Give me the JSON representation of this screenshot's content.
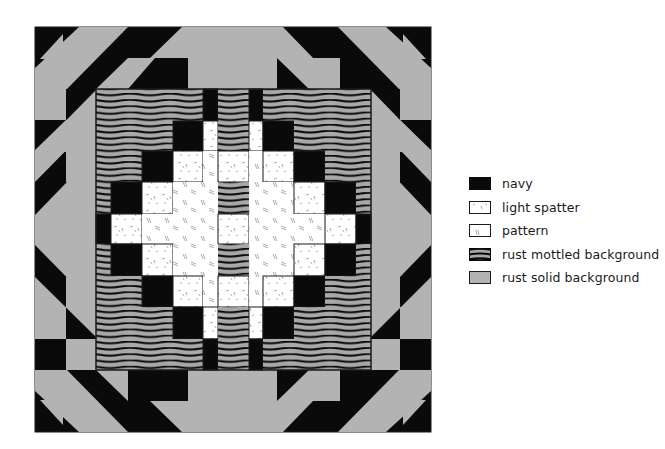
{
  "colors": {
    "navy": "#0a0a0a",
    "light_spatter": "#ffffff",
    "pattern": "#ffffff",
    "rust_mottled_background": "#a8a8a8",
    "rust_solid_background": "#b3b3b3",
    "outline": "#1a1a1a"
  },
  "legend": {
    "items": [
      {
        "key": "N",
        "label": "navy",
        "icon": "navy-swatch"
      },
      {
        "key": "S",
        "label": "light spatter",
        "icon": "light-spatter-swatch"
      },
      {
        "key": "P",
        "label": "pattern",
        "icon": "pattern-swatch"
      },
      {
        "key": "M",
        "label": "rust mottled background",
        "icon": "rust-mottled-swatch"
      },
      {
        "key": "R",
        "label": "rust solid background",
        "icon": "rust-solid-swatch"
      }
    ]
  },
  "quilt": {
    "outer": {
      "x": 35,
      "y": 27,
      "w": 396,
      "h": 405
    },
    "inner": {
      "x": 96,
      "y": 89,
      "w": 275,
      "h": 281
    },
    "col_edges": [
      96,
      111,
      142,
      173,
      203,
      218,
      249,
      263,
      294,
      325,
      356,
      371
    ],
    "row_edges": [
      89,
      121,
      151,
      182,
      214,
      244,
      276,
      307,
      339,
      370
    ],
    "grid": [
      [
        "M",
        "M",
        "M",
        "M",
        "N",
        "M",
        "N",
        "M",
        "M",
        "M",
        "M"
      ],
      [
        "M",
        "M",
        "M",
        "N",
        "S",
        "M",
        "S",
        "N",
        "M",
        "M",
        "M"
      ],
      [
        "M",
        "M",
        "N",
        "S",
        "P",
        "S",
        "P",
        "S",
        "N",
        "M",
        "M"
      ],
      [
        "M",
        "N",
        "S",
        "P",
        "P",
        "M",
        "P",
        "P",
        "S",
        "N",
        "M"
      ],
      [
        "N",
        "S",
        "P",
        "P",
        "P",
        "S",
        "P",
        "P",
        "P",
        "S",
        "N"
      ],
      [
        "M",
        "N",
        "S",
        "P",
        "P",
        "M",
        "P",
        "P",
        "S",
        "N",
        "M"
      ],
      [
        "M",
        "M",
        "N",
        "S",
        "P",
        "S",
        "P",
        "S",
        "N",
        "M",
        "M"
      ],
      [
        "M",
        "M",
        "M",
        "N",
        "S",
        "M",
        "S",
        "N",
        "M",
        "M",
        "M"
      ],
      [
        "M",
        "M",
        "M",
        "M",
        "N",
        "M",
        "N",
        "M",
        "M",
        "M",
        "M"
      ]
    ]
  }
}
